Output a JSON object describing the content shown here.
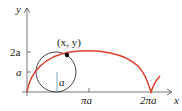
{
  "diagram": {
    "type": "cycloid",
    "axes": {
      "x_label": "x",
      "y_label": "y",
      "x_ticks": [
        "πa",
        "2πa"
      ],
      "y_ticks": [
        "a",
        "2a"
      ]
    },
    "point_label": "(x, y)",
    "radius_label": "a",
    "colors": {
      "curve": "#d9402a",
      "circle": "#333333",
      "radius": "#5b8fb0",
      "axes": "#555555"
    }
  }
}
